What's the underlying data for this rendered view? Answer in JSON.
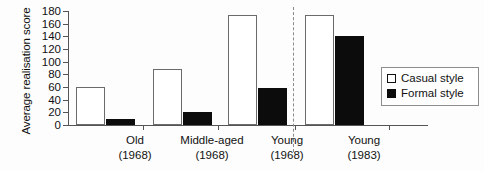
{
  "chart_data": {
    "type": "bar",
    "title": "",
    "xlabel": "",
    "ylabel": "Average realisation score",
    "ylim": [
      0,
      180
    ],
    "yticks": [
      0,
      20,
      40,
      60,
      80,
      100,
      120,
      140,
      160,
      180
    ],
    "grid": false,
    "legend_position": "right",
    "categories": [
      {
        "line1": "Old",
        "line2": "(1968)"
      },
      {
        "line1": "Middle-aged",
        "line2": "(1968)"
      },
      {
        "line1": "Young",
        "line2": "(1968)"
      },
      {
        "line1": "Young",
        "line2": "(1983)"
      }
    ],
    "series": [
      {
        "name": "Casual style",
        "color": "#ffffff",
        "values": [
          60,
          88,
          173,
          173
        ]
      },
      {
        "name": "Formal style",
        "color": "#0c0c0c",
        "values": [
          10,
          20,
          58,
          140
        ]
      }
    ],
    "annotations": [
      {
        "type": "dashed-vertical-divider",
        "after_category_index": 2
      }
    ]
  },
  "legend": {
    "items": [
      {
        "label": "Casual style",
        "swatch": "open-square-icon"
      },
      {
        "label": "Formal style",
        "swatch": "filled-square-icon"
      }
    ]
  },
  "axis": {
    "y_title": "Average realisation score",
    "y_labels": [
      "180",
      "160",
      "140",
      "120",
      "100",
      "80",
      "60",
      "40",
      "20",
      "0"
    ]
  }
}
